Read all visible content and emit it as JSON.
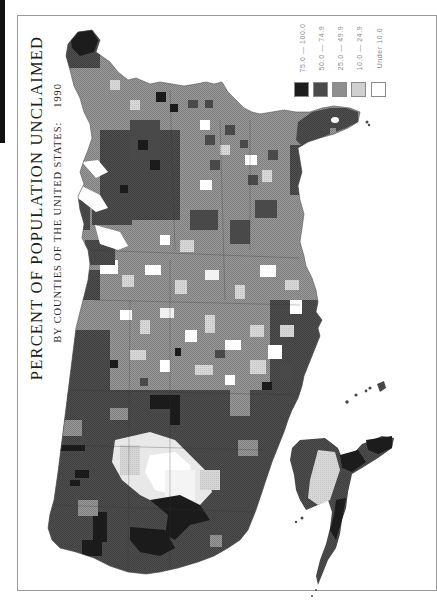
{
  "title": "PERCENT OF POPULATION UNCLAIMED",
  "subtitle": "BY COUNTIES OF THE UNITED STATES:",
  "year": "1990",
  "orientation": "rotated 90° counter-clockwise (north at left)",
  "legend": {
    "items": [
      {
        "label": "75.0 — 100.0",
        "color": "#1c1c1c"
      },
      {
        "label": "50.0 — 74.9",
        "color": "#4a4a4a"
      },
      {
        "label": "25.0 — 49.9",
        "color": "#8e8e8e"
      },
      {
        "label": "10.0 — 24.9",
        "color": "#cdcdcd"
      },
      {
        "label": "Under 10.0",
        "color": "#ffffff"
      }
    ]
  },
  "colors": {
    "frame": "#9a9a9a",
    "text": "#1e1e1e",
    "legend_text": "#8a8a8a",
    "class_1": "#1c1c1c",
    "class_2": "#4a4a4a",
    "class_3": "#8e8e8e",
    "class_4": "#cdcdcd",
    "class_5": "#ffffff"
  },
  "map_regions": {
    "conterminous_us": "Conterminous United States by county",
    "alaska": "Alaska",
    "hawaii": "Hawaii"
  },
  "regional_pattern": {
    "west": "predominantly 50.0 — 74.9 with scattered 75.0 — 100.0",
    "great_basin_utah": "predominantly Under 10.0 and 10.0 — 24.9",
    "great_plains": "mixed 10.0 — 24.9 and 25.0 — 49.9",
    "midwest_northeast": "mixed 25.0 — 74.9 with dark clusters",
    "florida": "predominantly 50.0 — 74.9",
    "alaska": "50.0 — 74.9 on edges, 10.0 — 24.9 in interior"
  }
}
